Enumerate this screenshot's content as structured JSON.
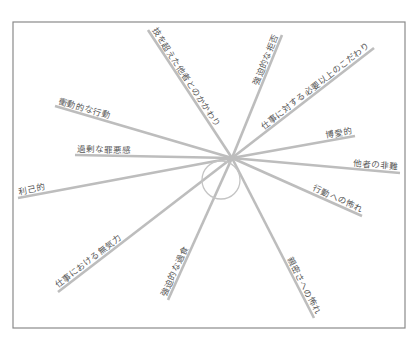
{
  "diagram": {
    "title": "",
    "type": "spider-diagram",
    "hub": {
      "cx": 221,
      "cy": 180,
      "r": 19
    },
    "colors": {
      "frame": "#8a8a8a",
      "spoke": "#bdbdbd",
      "text": "#555555"
    },
    "spokes": [
      {
        "label": "技を超えた他者とのかかわり",
        "x1": 148,
        "y1": 30,
        "x2": 232,
        "y2": 158
      },
      {
        "label": "強迫的な拒否",
        "x1": 282,
        "y1": 35,
        "x2": 232,
        "y2": 158
      },
      {
        "label": "仕事に対する必要以上のこだわり",
        "x1": 374,
        "y1": 48,
        "x2": 232,
        "y2": 158
      },
      {
        "label": "博愛的",
        "x1": 355,
        "y1": 136,
        "x2": 232,
        "y2": 158
      },
      {
        "label": "他者の非難",
        "x1": 400,
        "y1": 173,
        "x2": 232,
        "y2": 158
      },
      {
        "label": "行動への怖れ",
        "x1": 362,
        "y1": 216,
        "x2": 232,
        "y2": 158
      },
      {
        "label": "親密さへの怖れ",
        "x1": 314,
        "y1": 318,
        "x2": 232,
        "y2": 158
      },
      {
        "label": "強迫的な過食",
        "x1": 168,
        "y1": 300,
        "x2": 232,
        "y2": 158
      },
      {
        "label": "仕事における無気力",
        "x1": 58,
        "y1": 292,
        "x2": 232,
        "y2": 158
      },
      {
        "label": "利己的",
        "x1": 18,
        "y1": 198,
        "x2": 232,
        "y2": 158
      },
      {
        "label": "過剰な罪悪感",
        "x1": 75,
        "y1": 155,
        "x2": 232,
        "y2": 158
      },
      {
        "label": "衝動的な行動",
        "x1": 55,
        "y1": 106,
        "x2": 232,
        "y2": 158
      }
    ]
  }
}
